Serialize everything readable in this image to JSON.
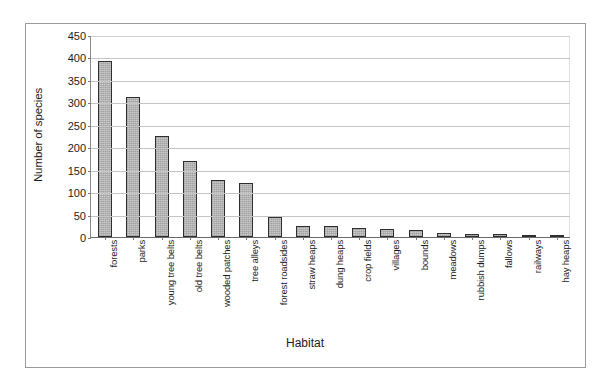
{
  "chart_data": {
    "type": "bar",
    "title": "",
    "xlabel": "Habitat",
    "ylabel": "Number of species",
    "ylim": [
      0,
      450
    ],
    "ytick_step": 50,
    "yticks": [
      450,
      400,
      350,
      300,
      250,
      200,
      150,
      100,
      50,
      0
    ],
    "grid": true,
    "legend": "none",
    "bar_color": "#c9c9c9",
    "bar_border_color": "#2e2e2e",
    "categories": [
      "forests",
      "parks",
      "young tree belts",
      "old tree belts",
      "wooded patches",
      "tree alleys",
      "forest roadsides",
      "straw heaps",
      "dung heaps",
      "crop fields",
      "villages",
      "bounds",
      "meadows",
      "rubbish dumps",
      "fallows",
      "railways",
      "hay heaps"
    ],
    "values": [
      393,
      312,
      225,
      170,
      127,
      120,
      45,
      25,
      25,
      19,
      17,
      16,
      9,
      7,
      6,
      3,
      1
    ]
  }
}
